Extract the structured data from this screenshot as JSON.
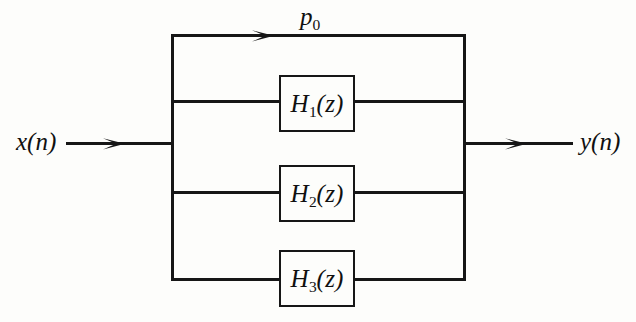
{
  "figure": {
    "type": "parallel-filter-block-diagram",
    "stroke_color": "#161616",
    "background_color": "#fdfdfb"
  },
  "labels": {
    "input": "x(n)",
    "output": "y(n)",
    "direct_path": {
      "symbol": "p",
      "subscript": "0"
    }
  },
  "blocks": [
    {
      "id": "H1",
      "symbol": "H",
      "subscript": "1",
      "argument": "(z)",
      "text": "H1(z)"
    },
    {
      "id": "H2",
      "symbol": "H",
      "subscript": "2",
      "argument": "(z)",
      "text": "H2(z)"
    },
    {
      "id": "H3",
      "symbol": "H",
      "subscript": "3",
      "argument": "(z)",
      "text": "H3(z)"
    }
  ],
  "branches": [
    {
      "name": "direct-path-p0",
      "has_block": false,
      "label": "p0"
    },
    {
      "name": "branch-h1",
      "has_block": true,
      "label": "H1(z)"
    },
    {
      "name": "branch-h2",
      "has_block": true,
      "label": "H2(z)"
    },
    {
      "name": "branch-h3",
      "has_block": true,
      "label": "H3(z)"
    }
  ]
}
